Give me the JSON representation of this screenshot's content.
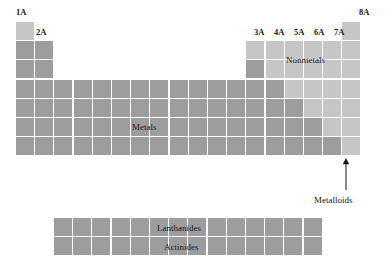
{
  "figure": {
    "type": "periodic-table-schematic",
    "title": "",
    "colors": {
      "metal": "#9d9d9d",
      "nonmetal": "#c6c6c6",
      "metalloid": "#9d9d9d",
      "background": "#ffffff",
      "text": "#1a1a1a"
    }
  },
  "group_labels": [
    {
      "text": "1A",
      "x": 16,
      "y": 8
    },
    {
      "text": "2A",
      "x": 36,
      "y": 28
    },
    {
      "text": "3A",
      "x": 254,
      "y": 28
    },
    {
      "text": "4A",
      "x": 274,
      "y": 28
    },
    {
      "text": "5A",
      "x": 294,
      "y": 28
    },
    {
      "text": "6A",
      "x": 314,
      "y": 28
    },
    {
      "text": "7A",
      "x": 334,
      "y": 28
    },
    {
      "text": "8A",
      "x": 359,
      "y": 8
    }
  ],
  "region_labels": [
    {
      "name": "metals",
      "text": "Metals",
      "x": 132,
      "y": 123
    },
    {
      "name": "nonmetals",
      "text": "Nonmetals",
      "x": 286,
      "y": 56
    },
    {
      "name": "metalloids",
      "text": "Metalloids",
      "x": 314,
      "y": 196
    },
    {
      "name": "lanthanides",
      "text": "Lanthanides",
      "x": 157,
      "y": 224
    },
    {
      "name": "actinides",
      "text": "Actinides",
      "x": 164,
      "y": 243
    }
  ],
  "arrow": {
    "name": "metalloids-pointer",
    "x": 346,
    "y_top": 158,
    "y_bottom": 190
  },
  "main_grid": {
    "origin_x": 16,
    "origin_y": 22,
    "cell": 18,
    "step": 19.2,
    "columns": 18,
    "rows": 7,
    "cells": [
      {
        "c": 1,
        "r": 1,
        "kind": "nonmetal"
      },
      {
        "c": 18,
        "r": 1,
        "kind": "nonmetal"
      },
      {
        "c": 1,
        "r": 2,
        "kind": "metal"
      },
      {
        "c": 2,
        "r": 2,
        "kind": "metal"
      },
      {
        "c": 13,
        "r": 2,
        "kind": "nonmetal"
      },
      {
        "c": 14,
        "r": 2,
        "kind": "nonmetal"
      },
      {
        "c": 15,
        "r": 2,
        "kind": "nonmetal"
      },
      {
        "c": 16,
        "r": 2,
        "kind": "nonmetal"
      },
      {
        "c": 17,
        "r": 2,
        "kind": "nonmetal"
      },
      {
        "c": 18,
        "r": 2,
        "kind": "nonmetal"
      },
      {
        "c": 1,
        "r": 3,
        "kind": "metal"
      },
      {
        "c": 2,
        "r": 3,
        "kind": "metal"
      },
      {
        "c": 13,
        "r": 3,
        "kind": "metalloid"
      },
      {
        "c": 14,
        "r": 3,
        "kind": "nonmetal"
      },
      {
        "c": 15,
        "r": 3,
        "kind": "nonmetal"
      },
      {
        "c": 16,
        "r": 3,
        "kind": "nonmetal"
      },
      {
        "c": 17,
        "r": 3,
        "kind": "nonmetal"
      },
      {
        "c": 18,
        "r": 3,
        "kind": "nonmetal"
      },
      {
        "c": 1,
        "r": 4,
        "kind": "metal"
      },
      {
        "c": 2,
        "r": 4,
        "kind": "metal"
      },
      {
        "c": 3,
        "r": 4,
        "kind": "metal"
      },
      {
        "c": 4,
        "r": 4,
        "kind": "metal"
      },
      {
        "c": 5,
        "r": 4,
        "kind": "metal"
      },
      {
        "c": 6,
        "r": 4,
        "kind": "metal"
      },
      {
        "c": 7,
        "r": 4,
        "kind": "metal"
      },
      {
        "c": 8,
        "r": 4,
        "kind": "metal"
      },
      {
        "c": 9,
        "r": 4,
        "kind": "metal"
      },
      {
        "c": 10,
        "r": 4,
        "kind": "metal"
      },
      {
        "c": 11,
        "r": 4,
        "kind": "metal"
      },
      {
        "c": 12,
        "r": 4,
        "kind": "metal"
      },
      {
        "c": 13,
        "r": 4,
        "kind": "metal"
      },
      {
        "c": 14,
        "r": 4,
        "kind": "metalloid"
      },
      {
        "c": 15,
        "r": 4,
        "kind": "nonmetal"
      },
      {
        "c": 16,
        "r": 4,
        "kind": "nonmetal"
      },
      {
        "c": 17,
        "r": 4,
        "kind": "nonmetal"
      },
      {
        "c": 18,
        "r": 4,
        "kind": "nonmetal"
      },
      {
        "c": 1,
        "r": 5,
        "kind": "metal"
      },
      {
        "c": 2,
        "r": 5,
        "kind": "metal"
      },
      {
        "c": 3,
        "r": 5,
        "kind": "metal"
      },
      {
        "c": 4,
        "r": 5,
        "kind": "metal"
      },
      {
        "c": 5,
        "r": 5,
        "kind": "metal"
      },
      {
        "c": 6,
        "r": 5,
        "kind": "metal"
      },
      {
        "c": 7,
        "r": 5,
        "kind": "metal"
      },
      {
        "c": 8,
        "r": 5,
        "kind": "metal"
      },
      {
        "c": 9,
        "r": 5,
        "kind": "metal"
      },
      {
        "c": 10,
        "r": 5,
        "kind": "metal"
      },
      {
        "c": 11,
        "r": 5,
        "kind": "metal"
      },
      {
        "c": 12,
        "r": 5,
        "kind": "metal"
      },
      {
        "c": 13,
        "r": 5,
        "kind": "metal"
      },
      {
        "c": 14,
        "r": 5,
        "kind": "metalloid"
      },
      {
        "c": 15,
        "r": 5,
        "kind": "metalloid"
      },
      {
        "c": 16,
        "r": 5,
        "kind": "nonmetal"
      },
      {
        "c": 17,
        "r": 5,
        "kind": "nonmetal"
      },
      {
        "c": 18,
        "r": 5,
        "kind": "nonmetal"
      },
      {
        "c": 1,
        "r": 6,
        "kind": "metal"
      },
      {
        "c": 2,
        "r": 6,
        "kind": "metal"
      },
      {
        "c": 3,
        "r": 6,
        "kind": "metal"
      },
      {
        "c": 4,
        "r": 6,
        "kind": "metal"
      },
      {
        "c": 5,
        "r": 6,
        "kind": "metal"
      },
      {
        "c": 6,
        "r": 6,
        "kind": "metal"
      },
      {
        "c": 7,
        "r": 6,
        "kind": "metal"
      },
      {
        "c": 8,
        "r": 6,
        "kind": "metal"
      },
      {
        "c": 9,
        "r": 6,
        "kind": "metal"
      },
      {
        "c": 10,
        "r": 6,
        "kind": "metal"
      },
      {
        "c": 11,
        "r": 6,
        "kind": "metal"
      },
      {
        "c": 12,
        "r": 6,
        "kind": "metal"
      },
      {
        "c": 13,
        "r": 6,
        "kind": "metal"
      },
      {
        "c": 14,
        "r": 6,
        "kind": "metal"
      },
      {
        "c": 15,
        "r": 6,
        "kind": "metalloid"
      },
      {
        "c": 16,
        "r": 6,
        "kind": "metalloid"
      },
      {
        "c": 17,
        "r": 6,
        "kind": "nonmetal"
      },
      {
        "c": 18,
        "r": 6,
        "kind": "nonmetal"
      },
      {
        "c": 1,
        "r": 7,
        "kind": "metal"
      },
      {
        "c": 2,
        "r": 7,
        "kind": "metal"
      },
      {
        "c": 3,
        "r": 7,
        "kind": "metal"
      },
      {
        "c": 4,
        "r": 7,
        "kind": "metal"
      },
      {
        "c": 5,
        "r": 7,
        "kind": "metal"
      },
      {
        "c": 6,
        "r": 7,
        "kind": "metal"
      },
      {
        "c": 7,
        "r": 7,
        "kind": "metal"
      },
      {
        "c": 8,
        "r": 7,
        "kind": "metal"
      },
      {
        "c": 9,
        "r": 7,
        "kind": "metal"
      },
      {
        "c": 10,
        "r": 7,
        "kind": "metal"
      },
      {
        "c": 11,
        "r": 7,
        "kind": "metal"
      },
      {
        "c": 12,
        "r": 7,
        "kind": "metal"
      },
      {
        "c": 13,
        "r": 7,
        "kind": "metal"
      },
      {
        "c": 14,
        "r": 7,
        "kind": "metal"
      },
      {
        "c": 15,
        "r": 7,
        "kind": "metal"
      },
      {
        "c": 16,
        "r": 7,
        "kind": "metalloid"
      },
      {
        "c": 17,
        "r": 7,
        "kind": "metalloid"
      },
      {
        "c": 18,
        "r": 7,
        "kind": "nonmetal"
      }
    ]
  },
  "f_block": {
    "origin_x": 54,
    "origin_y": 218,
    "cell": 18,
    "step": 19.2,
    "columns": 14,
    "rows": 2,
    "kind": "metal",
    "row_names": [
      "Lanthanides",
      "Actinides"
    ]
  }
}
